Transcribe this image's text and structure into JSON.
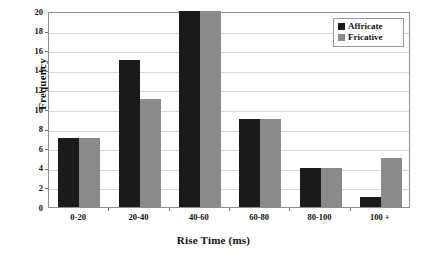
{
  "chart_data": {
    "type": "bar",
    "title": "",
    "subtitle": "",
    "xlabel": "Rise Time (ms)",
    "ylabel": "Frequency",
    "categories": [
      "0-20",
      "20-40",
      "40-60",
      "60-80",
      "80-100",
      "100 +"
    ],
    "series": [
      {
        "name": "Affricate",
        "color": "#1a1a1a",
        "values": [
          7,
          15,
          20,
          9,
          4,
          1
        ]
      },
      {
        "name": "Fricative",
        "color": "#8a8a8a",
        "values": [
          7,
          11,
          20,
          9,
          4,
          5
        ]
      }
    ],
    "ylim": [
      0,
      20
    ],
    "ytick_labels": [
      "20",
      "18",
      "16",
      "14",
      "12",
      "10",
      "8",
      "6",
      "4",
      "2",
      "0"
    ],
    "ytick_values": [
      20,
      18,
      16,
      14,
      12,
      10,
      8,
      6,
      4,
      2,
      0
    ],
    "ytick_step": 2,
    "grid": true,
    "grid_axis": "y",
    "legend_position": "top-right"
  },
  "colors": {
    "series_affricate": "#1a1a1a",
    "series_fricative": "#8a8a8a",
    "gridline": "#d8d8d8",
    "axis": "#8e8e8e",
    "text": "#111111",
    "background": "#ffffff"
  }
}
